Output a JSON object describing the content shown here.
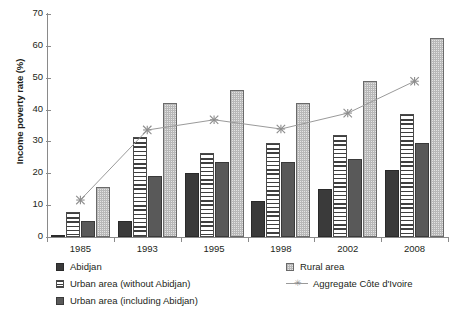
{
  "chart_data": {
    "type": "bar",
    "title": "",
    "subtitle": "",
    "xlabel": "",
    "ylabel": "Income poverty rate (%)",
    "categories": [
      "1985",
      "1993",
      "1995",
      "1998",
      "2002",
      "2008"
    ],
    "ylim": [
      0,
      70
    ],
    "yticks": [
      0,
      10,
      20,
      30,
      40,
      50,
      60,
      70
    ],
    "grid": false,
    "legend_position": "bottom",
    "series": [
      {
        "name": "Abidjan",
        "type": "bar",
        "values": [
          0.7,
          5.0,
          20.2,
          11.2,
          15.0,
          21.0
        ]
      },
      {
        "name": "Urban area (without Abidjan)",
        "type": "bar",
        "values": [
          8.0,
          31.5,
          26.3,
          29.5,
          32.0,
          38.6
        ]
      },
      {
        "name": "Urban area (including Abidjan)",
        "type": "bar",
        "values": [
          5.0,
          19.0,
          23.7,
          23.6,
          24.5,
          29.5
        ]
      },
      {
        "name": "Rural area",
        "type": "bar",
        "values": [
          15.8,
          42.0,
          46.2,
          42.0,
          49.0,
          62.5
        ]
      },
      {
        "name": "Aggregate Côte d'Ivoire",
        "type": "line",
        "values": [
          11.6,
          33.6,
          36.8,
          33.9,
          38.9,
          48.9
        ]
      }
    ]
  },
  "axis": {
    "y_tick_labels": [
      "70",
      "60",
      "50",
      "40",
      "30",
      "20",
      "10",
      "0"
    ],
    "x_tick_labels": [
      "1985",
      "1993",
      "1995",
      "1998",
      "2002",
      "2008"
    ],
    "y_title": "Income poverty rate (%)"
  },
  "legend": {
    "left_items": [
      {
        "key": "abidjan",
        "label": "Abidjan"
      },
      {
        "key": "urban-wo",
        "label": "Urban area (without Abidjan)"
      },
      {
        "key": "urban-incl",
        "label": "Urban area (including Abidjan)"
      }
    ],
    "right_items": [
      {
        "key": "rural",
        "label": "Rural area"
      },
      {
        "key": "aggregate",
        "label": "Aggregate Côte d'Ivoire"
      }
    ]
  },
  "colors": {
    "abidjan": "#3a3a3a",
    "urban_without": "#ffffff",
    "urban_including": "#595959",
    "rural": "#e3e3e3",
    "aggregate_line": "#9a9a9a",
    "axis": "#8a8a8a",
    "text": "#231f20",
    "background": "#ffffff"
  }
}
